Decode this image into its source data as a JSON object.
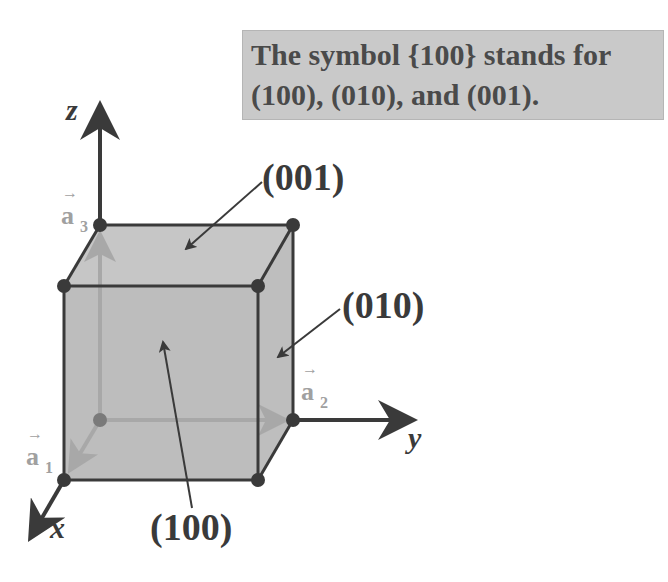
{
  "caption": {
    "line1": "The symbol {100} stands for",
    "line2": "(100), (010), and (001)."
  },
  "axes": {
    "x": "x",
    "y": "y",
    "z": "z"
  },
  "vectors": {
    "a1": {
      "base": "a",
      "sub": "1"
    },
    "a2": {
      "base": "a",
      "sub": "2"
    },
    "a3": {
      "base": "a",
      "sub": "3"
    }
  },
  "planes": {
    "top": "(001)",
    "right": "(010)",
    "front": "(100)"
  },
  "colors": {
    "face_fill": "#bdbdbd",
    "edge": "#3a3a3a",
    "vector": "#a0a0a0",
    "caption_bg": "#c9c9c9"
  }
}
